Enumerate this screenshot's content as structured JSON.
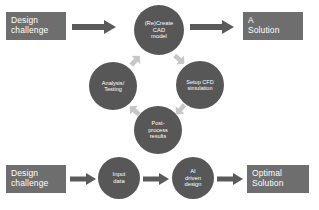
{
  "diagram": {
    "colors": {
      "rectangle_fill": "#6e6e6e",
      "circle_fill": "#575757",
      "arrow_fill": "#5a5a5a",
      "cycle_arrow_fill": "#c7c7c7",
      "label_text": "#ffffff",
      "background": "#ffffff"
    },
    "top_flow": {
      "start_box": "Design\nchallenge",
      "end_box": "A\nSolution",
      "cycle_nodes": [
        "(Re)Create\nCAD\nmodel",
        "Setup CFD\nsimulation",
        "Post-\nprocess\nresults",
        "Analysis/\nTesting"
      ]
    },
    "bottom_flow": {
      "start_box": "Design\nchallenge",
      "nodes": [
        "Input\ndata",
        "AI\ndriven\ndesign"
      ],
      "end_box": "Optimal\nSolution"
    }
  }
}
